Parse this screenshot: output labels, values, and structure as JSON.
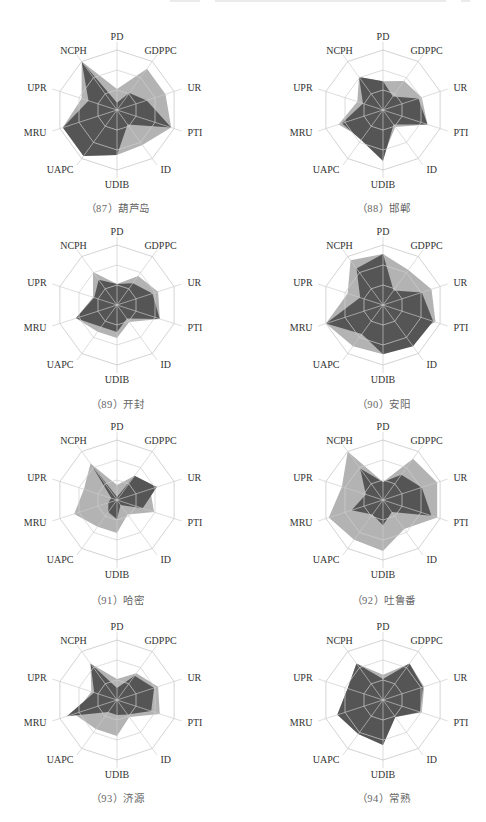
{
  "page": {
    "header_text": ""
  },
  "chart_data": [
    {
      "type": "radar",
      "title": "（87）葫芦岛",
      "axes": [
        "PD",
        "GDPPC",
        "UR",
        "PTI",
        "ID",
        "UDIB",
        "UAPC",
        "MRU",
        "UPR",
        "NCPH"
      ],
      "rlim": [
        0,
        1
      ],
      "rings": 3,
      "series": [
        {
          "name": "light",
          "color": "#b3b3b3",
          "values": [
            0.35,
            0.85,
            0.85,
            0.95,
            0.72,
            0.75,
            0.95,
            0.95,
            0.62,
            1.0
          ]
        },
        {
          "name": "dark",
          "color": "#555555",
          "values": [
            0.12,
            0.35,
            0.52,
            0.95,
            0.3,
            0.75,
            0.95,
            0.95,
            0.5,
            1.0
          ]
        }
      ]
    },
    {
      "type": "radar",
      "title": "（88）邯郸",
      "axes": [
        "PD",
        "GDPPC",
        "UR",
        "PTI",
        "ID",
        "UDIB",
        "UAPC",
        "MRU",
        "UPR",
        "NCPH"
      ],
      "rlim": [
        0,
        1
      ],
      "rings": 3,
      "series": [
        {
          "name": "light",
          "color": "#b3b3b3",
          "values": [
            0.48,
            0.6,
            0.68,
            0.78,
            0.35,
            0.78,
            0.58,
            0.78,
            0.45,
            0.68
          ]
        },
        {
          "name": "dark",
          "color": "#555555",
          "values": [
            0.48,
            0.28,
            0.62,
            0.78,
            0.3,
            0.85,
            0.62,
            0.72,
            0.35,
            0.68
          ]
        }
      ]
    },
    {
      "type": "radar",
      "title": "（89）开封",
      "axes": [
        "PD",
        "GDPPC",
        "UR",
        "PTI",
        "ID",
        "UDIB",
        "UAPC",
        "MRU",
        "UPR",
        "NCPH"
      ],
      "rlim": [
        0,
        1
      ],
      "rings": 3,
      "series": [
        {
          "name": "light",
          "color": "#b3b3b3",
          "values": [
            0.35,
            0.6,
            0.72,
            0.75,
            0.35,
            0.55,
            0.55,
            0.72,
            0.42,
            0.68
          ]
        },
        {
          "name": "dark",
          "color": "#555555",
          "values": [
            0.35,
            0.45,
            0.62,
            0.75,
            0.28,
            0.45,
            0.45,
            0.72,
            0.4,
            0.52
          ]
        }
      ]
    },
    {
      "type": "radar",
      "title": "（90）安阳",
      "axes": [
        "PD",
        "GDPPC",
        "UR",
        "PTI",
        "ID",
        "UDIB",
        "UAPC",
        "MRU",
        "UPR",
        "NCPH"
      ],
      "rlim": [
        0,
        1
      ],
      "rings": 3,
      "series": [
        {
          "name": "light",
          "color": "#b3b3b3",
          "values": [
            0.85,
            0.72,
            0.85,
            0.92,
            0.65,
            0.82,
            0.85,
            1.0,
            0.62,
            0.92
          ]
        },
        {
          "name": "dark",
          "color": "#555555",
          "values": [
            0.85,
            0.3,
            0.68,
            0.88,
            0.85,
            0.82,
            0.6,
            1.0,
            0.4,
            0.75
          ]
        }
      ]
    },
    {
      "type": "radar",
      "title": "（91）哈密",
      "axes": [
        "PD",
        "GDPPC",
        "UR",
        "PTI",
        "ID",
        "UDIB",
        "UAPC",
        "MRU",
        "UPR",
        "NCPH"
      ],
      "rlim": [
        0,
        1
      ],
      "rings": 3,
      "series": [
        {
          "name": "light",
          "color": "#b3b3b3",
          "values": [
            0.25,
            0.5,
            0.58,
            0.65,
            0.3,
            0.55,
            0.55,
            0.75,
            0.58,
            0.75
          ]
        },
        {
          "name": "dark",
          "color": "#555555",
          "values": [
            0.05,
            0.5,
            0.7,
            0.45,
            0.1,
            0.32,
            0.25,
            0.15,
            0.1,
            0.75
          ]
        }
      ]
    },
    {
      "type": "radar",
      "title": "（92）吐鲁番",
      "axes": [
        "PD",
        "GDPPC",
        "UR",
        "PTI",
        "ID",
        "UDIB",
        "UAPC",
        "MRU",
        "UPR",
        "NCPH"
      ],
      "rlim": [
        0,
        1
      ],
      "rings": 3,
      "series": [
        {
          "name": "light",
          "color": "#b3b3b3",
          "values": [
            0.3,
            0.85,
            0.95,
            0.95,
            0.6,
            0.85,
            0.82,
            0.95,
            0.72,
            1.0
          ]
        },
        {
          "name": "dark",
          "color": "#555555",
          "values": [
            0.3,
            0.52,
            0.68,
            0.85,
            0.25,
            0.42,
            0.3,
            0.55,
            0.3,
            0.65
          ]
        }
      ]
    },
    {
      "type": "radar",
      "title": "（93）济源",
      "axes": [
        "PD",
        "GDPPC",
        "UR",
        "PTI",
        "ID",
        "UDIB",
        "UAPC",
        "MRU",
        "UPR",
        "NCPH"
      ],
      "rlim": [
        0,
        1
      ],
      "rings": 3,
      "series": [
        {
          "name": "light",
          "color": "#b3b3b3",
          "values": [
            0.35,
            0.55,
            0.72,
            0.75,
            0.35,
            0.6,
            0.6,
            0.75,
            0.45,
            0.75
          ]
        },
        {
          "name": "dark",
          "color": "#555555",
          "values": [
            0.2,
            0.5,
            0.65,
            0.6,
            0.3,
            0.25,
            0.25,
            0.88,
            0.4,
            0.75
          ]
        }
      ]
    },
    {
      "type": "radar",
      "title": "（94）常熟",
      "axes": [
        "PD",
        "GDPPC",
        "UR",
        "PTI",
        "ID",
        "UDIB",
        "UAPC",
        "MRU",
        "UPR",
        "NCPH"
      ],
      "rlim": [
        0,
        1
      ],
      "rings": 3,
      "series": [
        {
          "name": "light",
          "color": "#b3b3b3",
          "values": [
            0.42,
            0.75,
            0.72,
            0.68,
            0.35,
            0.75,
            0.7,
            0.8,
            0.62,
            0.75
          ]
        },
        {
          "name": "dark",
          "color": "#555555",
          "values": [
            0.35,
            0.75,
            0.7,
            0.65,
            0.35,
            0.75,
            0.7,
            0.8,
            0.62,
            0.75
          ]
        }
      ]
    }
  ],
  "captions": [
    "（87）葫芦岛",
    "（88）邯郸",
    "（89）开封",
    "（90）安阳",
    "（91）哈密",
    "（92）吐鲁番",
    "（93）济源",
    "（94）常熟"
  ]
}
